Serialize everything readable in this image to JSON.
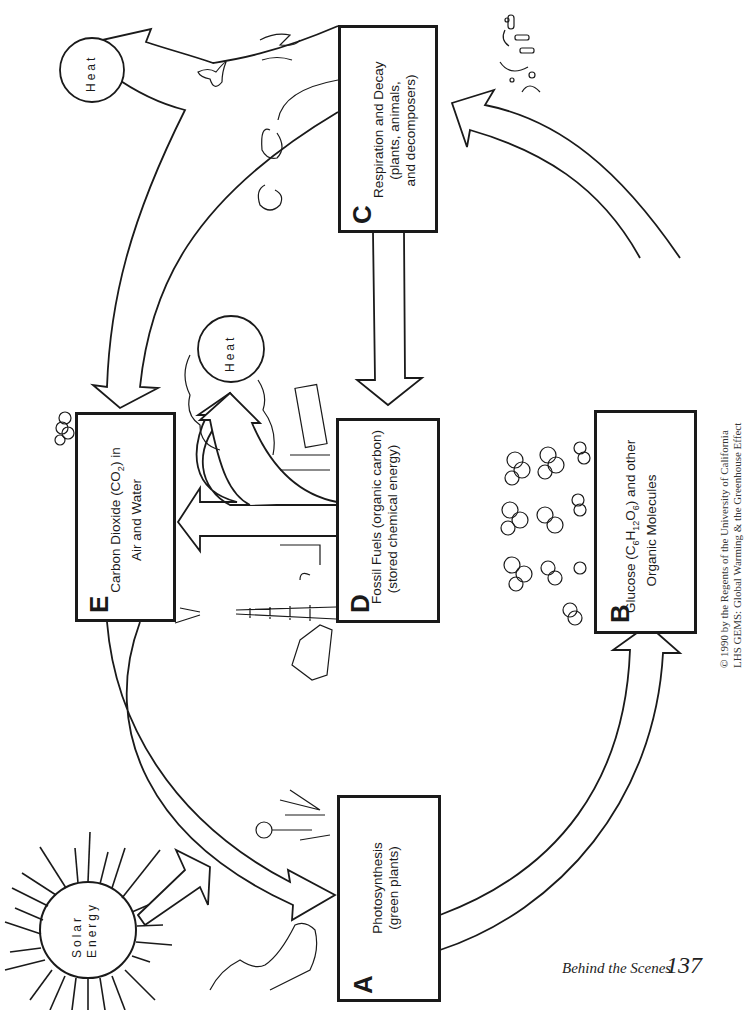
{
  "diagram": {
    "orientation": "rotated 90 degrees counter-clockwise",
    "nodes": [
      {
        "id": "A",
        "letter": "A",
        "line1": "Photosynthesis",
        "line2": "(green plants)",
        "line3": ""
      },
      {
        "id": "B",
        "letter": "B",
        "line1_prefix": "Glucose (C",
        "line1_sub1": "6",
        "line1_mid1": "H",
        "line1_sub2": "12",
        "line1_mid2": "O",
        "line1_sub3": "6",
        "line1_suffix": ") and other",
        "line2": "Organic Molecules"
      },
      {
        "id": "C",
        "letter": "C",
        "line1": "Respiration and Decay",
        "line2": "(plants, animals,",
        "line3": "and decomposers)"
      },
      {
        "id": "D",
        "letter": "D",
        "line1": "Fossil Fuels (organic carbon)",
        "line2": "(stored chemical energy)"
      },
      {
        "id": "E",
        "letter": "E",
        "line1_prefix": "Carbon Dioxide (CO",
        "line1_sub": "2",
        "line1_suffix": ") in",
        "line2": "Air and Water"
      }
    ],
    "energy_labels": {
      "solar_line1": "Solar",
      "solar_line2": "Energy",
      "heat_top": "Heat",
      "heat_middle": "Heat"
    },
    "edges": [
      {
        "from": "Solar Energy",
        "to": "A"
      },
      {
        "from": "E",
        "to": "A"
      },
      {
        "from": "A",
        "to": "B"
      },
      {
        "from": "B",
        "to": "C"
      },
      {
        "from": "C",
        "to": "E"
      },
      {
        "from": "C",
        "to": "Heat"
      },
      {
        "from": "C",
        "to": "D"
      },
      {
        "from": "D",
        "to": "E"
      },
      {
        "from": "D",
        "to": "Heat"
      }
    ],
    "illustrations": [
      "sun",
      "trees",
      "flower",
      "grass",
      "birds",
      "sheep",
      "goat",
      "bacteria",
      "molecules",
      "car",
      "oil derrick",
      "factory",
      "ship",
      "clouds"
    ]
  },
  "credits": {
    "line1": "© 1990 by the Regents of the University of California",
    "line2": "LHS GEMS: Global Warming & the Greenhouse Effect"
  },
  "footer": {
    "section": "Behind the Scenes",
    "page_number": "137"
  }
}
